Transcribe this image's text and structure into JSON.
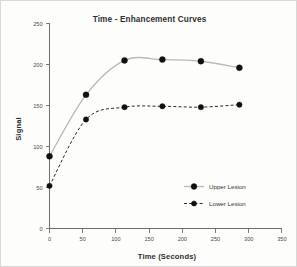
{
  "chart_data": {
    "type": "line",
    "title": "Time - Enhancement Curves",
    "xlabel": "Time (Seconds)",
    "ylabel": "Signal",
    "xlim": [
      0,
      350
    ],
    "ylim": [
      0,
      250
    ],
    "xticks": [
      0,
      50,
      100,
      150,
      200,
      250,
      300,
      350
    ],
    "yticks": [
      0,
      50,
      100,
      150,
      200,
      250
    ],
    "grid": false,
    "legend_position": "lower-right-inside",
    "x": [
      0,
      55,
      113,
      170,
      228,
      286
    ],
    "series": [
      {
        "name": "Upper Lesion",
        "values": [
          88,
          163,
          205,
          206,
          204,
          196
        ],
        "color": "#b9b9b9",
        "linestyle": "solid",
        "marker": "filled-circle"
      },
      {
        "name": "Lower Lesion",
        "values": [
          52,
          133,
          148,
          149,
          148,
          151
        ],
        "color": "#2a2a2a",
        "linestyle": "dashed",
        "marker": "filled-circle"
      }
    ]
  },
  "legend": {
    "entries": [
      {
        "label": "Upper Lesion"
      },
      {
        "label": "Lower Lesion"
      }
    ]
  },
  "axis_tick_labels": {
    "x": [
      "0",
      "50",
      "100",
      "150",
      "200",
      "250",
      "300",
      "350"
    ],
    "y": [
      "0",
      "50",
      "100",
      "150",
      "200",
      "250"
    ]
  }
}
